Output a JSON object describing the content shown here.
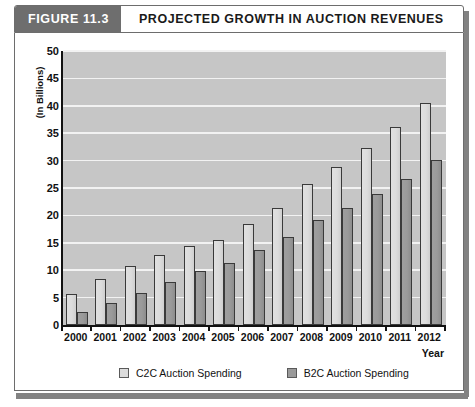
{
  "header": {
    "figure_number": "FIGURE 11.3",
    "title": "PROJECTED GROWTH IN AUCTION REVENUES"
  },
  "colors": {
    "header_tab": "#6e6e6e",
    "plot_background": "#c6c6c6",
    "gridline": "#f2f2f2",
    "c2c_bar": "#dcdcdc",
    "b2c_bar": "#9a9a9a",
    "axis": "#111111"
  },
  "chart_data": {
    "type": "bar",
    "title": "PROJECTED GROWTH IN AUCTION REVENUES",
    "xlabel": "Year",
    "ylabel": "(In Billions)",
    "ylim": [
      0,
      50
    ],
    "yticks": [
      0,
      5,
      10,
      15,
      20,
      25,
      30,
      35,
      40,
      45,
      50
    ],
    "ytick_labels": [
      "0",
      "5",
      "10",
      "15",
      "20",
      "25",
      "30",
      "35",
      "40",
      "45",
      "50"
    ],
    "grid": true,
    "legend_position": "bottom",
    "categories": [
      "2000",
      "2001",
      "2002",
      "2003",
      "2004",
      "2005",
      "2006",
      "2007",
      "2008",
      "2009",
      "2010",
      "2011",
      "2012"
    ],
    "series": [
      {
        "name": "C2C Auction Spending",
        "values": [
          5.7,
          8.4,
          10.7,
          12.8,
          14.4,
          15.5,
          18.4,
          21.3,
          25.7,
          28.9,
          32.3,
          36.2,
          40.5
        ]
      },
      {
        "name": "B2C Auction Spending",
        "values": [
          2.4,
          4.1,
          5.8,
          7.8,
          9.8,
          11.3,
          13.6,
          16.0,
          19.1,
          21.3,
          23.9,
          26.6,
          30.1
        ]
      }
    ]
  }
}
